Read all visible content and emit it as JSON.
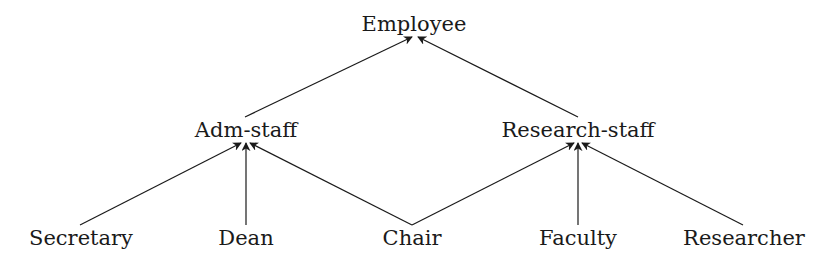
{
  "diagram": {
    "type": "hierarchy",
    "colors": {
      "ink": "#1a1a1a",
      "background": "#ffffff"
    },
    "nodes": {
      "employee": {
        "label": "Employee",
        "x": 414,
        "y": 14
      },
      "adm_staff": {
        "label": "Adm-staff",
        "x": 246,
        "y": 120
      },
      "research_staff": {
        "label": "Research-staff",
        "x": 578,
        "y": 120
      },
      "secretary": {
        "label": "Secretary",
        "x": 81,
        "y": 228
      },
      "dean": {
        "label": "Dean",
        "x": 246,
        "y": 228
      },
      "chair": {
        "label": "Chair",
        "x": 412,
        "y": 228
      },
      "faculty": {
        "label": "Faculty",
        "x": 578,
        "y": 228
      },
      "researcher": {
        "label": "Researcher",
        "x": 744,
        "y": 228
      }
    },
    "edges": [
      {
        "from": "adm_staff",
        "to": "employee",
        "x1": 245,
        "y1": 117,
        "x2": 412,
        "y2": 37
      },
      {
        "from": "research_staff",
        "to": "employee",
        "x1": 578,
        "y1": 117,
        "x2": 418,
        "y2": 37
      },
      {
        "from": "secretary",
        "to": "adm_staff",
        "x1": 80,
        "y1": 225,
        "x2": 241,
        "y2": 143
      },
      {
        "from": "dean",
        "to": "adm_staff",
        "x1": 246,
        "y1": 225,
        "x2": 246,
        "y2": 143
      },
      {
        "from": "chair",
        "to": "adm_staff",
        "x1": 412,
        "y1": 225,
        "x2": 250,
        "y2": 143
      },
      {
        "from": "chair",
        "to": "research_staff",
        "x1": 412,
        "y1": 225,
        "x2": 574,
        "y2": 143
      },
      {
        "from": "faculty",
        "to": "research_staff",
        "x1": 578,
        "y1": 225,
        "x2": 578,
        "y2": 143
      },
      {
        "from": "researcher",
        "to": "research_staff",
        "x1": 743,
        "y1": 225,
        "x2": 582,
        "y2": 143
      }
    ]
  }
}
